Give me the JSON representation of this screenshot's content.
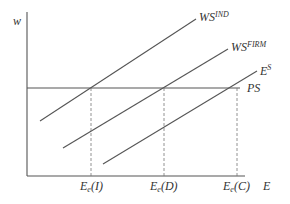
{
  "diagram": {
    "title": "",
    "axes": {
      "y_label": "w",
      "x_label": "E"
    },
    "curves": [
      {
        "id": "ws_ind",
        "label_main": "WS",
        "label_sup": "IND"
      },
      {
        "id": "ws_firm",
        "label_main": "WS",
        "label_sup": "FIRM"
      },
      {
        "id": "es",
        "label_main": "E",
        "label_sup": "S"
      }
    ],
    "horizontal_line": {
      "id": "ps",
      "label": "PS"
    },
    "equilibria": [
      {
        "id": "I",
        "label_main": "E",
        "label_sub": "e",
        "label_arg": "(I)"
      },
      {
        "id": "D",
        "label_main": "E",
        "label_sub": "e",
        "label_arg": "(D)"
      },
      {
        "id": "C",
        "label_main": "E",
        "label_sub": "e",
        "label_arg": "(C)"
      }
    ],
    "colors": {
      "line": "#555555",
      "text": "#333333",
      "background": "#ffffff"
    }
  }
}
